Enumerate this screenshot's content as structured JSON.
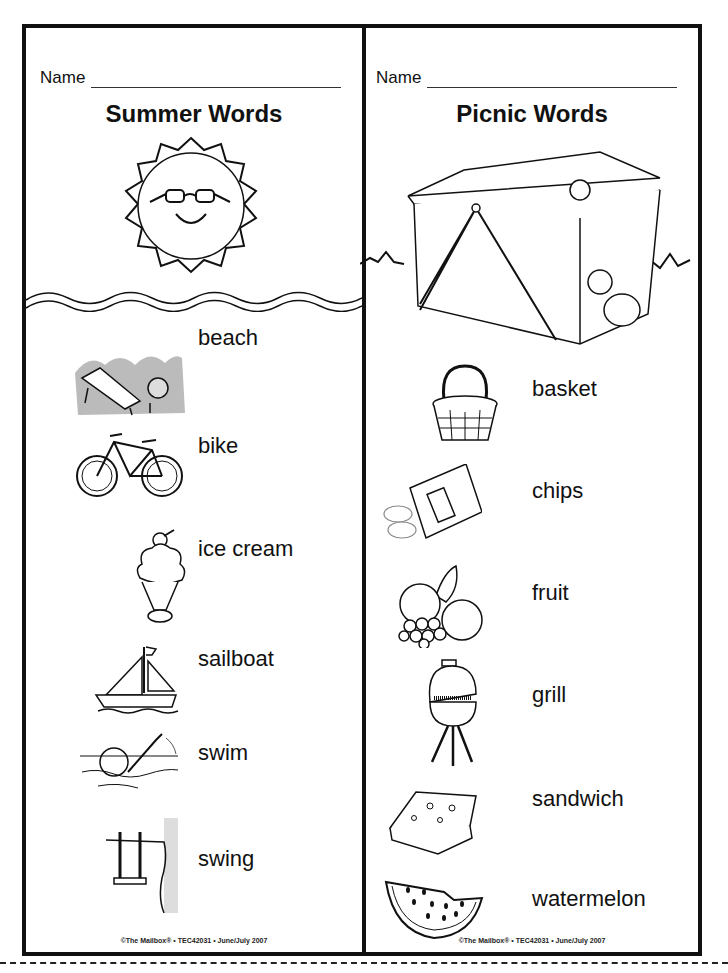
{
  "left_card": {
    "name_label": "Name",
    "title": "Summer Words",
    "header_art": "sun-with-sunglasses",
    "words": [
      {
        "label": "beach",
        "icon": "beach-chair-icon"
      },
      {
        "label": "bike",
        "icon": "bicycle-icon"
      },
      {
        "label": "ice cream",
        "icon": "ice-cream-sundae-icon"
      },
      {
        "label": "sailboat",
        "icon": "sailboat-icon"
      },
      {
        "label": "swim",
        "icon": "swimmer-icon"
      },
      {
        "label": "swing",
        "icon": "tree-swing-icon"
      }
    ],
    "footer": "©The Mailbox® • TEC42031 • June/July 2007"
  },
  "right_card": {
    "name_label": "Name",
    "title": "Picnic Words",
    "header_art": "picnic-basket-with-ants",
    "words": [
      {
        "label": "basket",
        "icon": "basket-icon"
      },
      {
        "label": "chips",
        "icon": "chips-bag-icon"
      },
      {
        "label": "fruit",
        "icon": "fruit-bowl-icon"
      },
      {
        "label": "grill",
        "icon": "grill-icon"
      },
      {
        "label": "sandwich",
        "icon": "sandwich-icon"
      },
      {
        "label": "watermelon",
        "icon": "watermelon-slice-icon"
      }
    ],
    "footer": "©The Mailbox® • TEC42031 • June/July 2007"
  }
}
